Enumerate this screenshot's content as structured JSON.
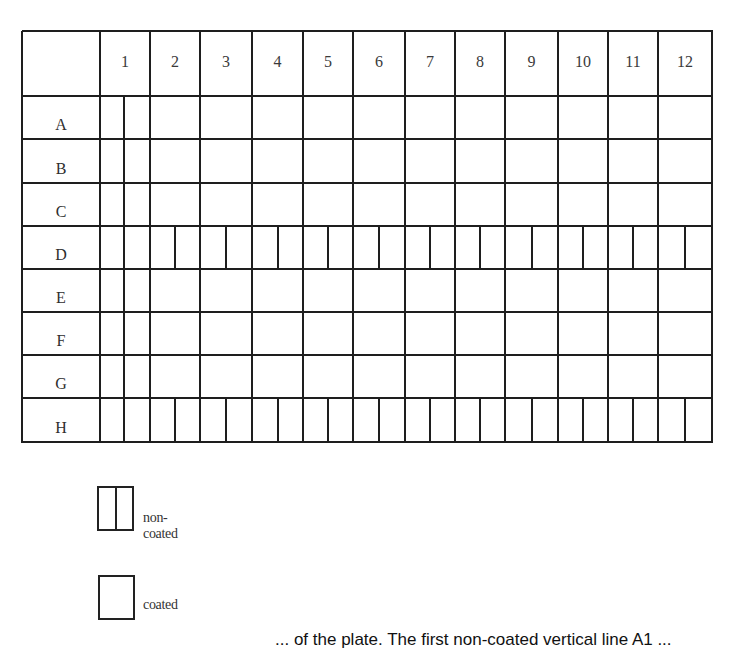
{
  "plate": {
    "columns": [
      "1",
      "2",
      "3",
      "4",
      "5",
      "6",
      "7",
      "8",
      "9",
      "10",
      "11",
      "12"
    ],
    "rows": [
      "A",
      "B",
      "C",
      "D",
      "E",
      "F",
      "G",
      "H"
    ],
    "non_coated_rows": [
      "D",
      "H"
    ],
    "non_coated_columns": [
      "1"
    ],
    "layout": {
      "col_edges": [
        0,
        78,
        128,
        178,
        230,
        281,
        331,
        383,
        433,
        483,
        536,
        586,
        636,
        690
      ],
      "row_edges": [
        0,
        65,
        108,
        152,
        195,
        238,
        281,
        324,
        367,
        411
      ]
    }
  },
  "legend": {
    "items": [
      {
        "label": "non-coated",
        "style": "split"
      },
      {
        "label": "coated",
        "style": "plain"
      }
    ]
  },
  "caption": {
    "text": "... of the plate. The first non-coated vertical line A1 ..."
  },
  "colors": {
    "line": "#1e1e1e",
    "background": "#ffffff",
    "text": "#2a2a2a"
  }
}
